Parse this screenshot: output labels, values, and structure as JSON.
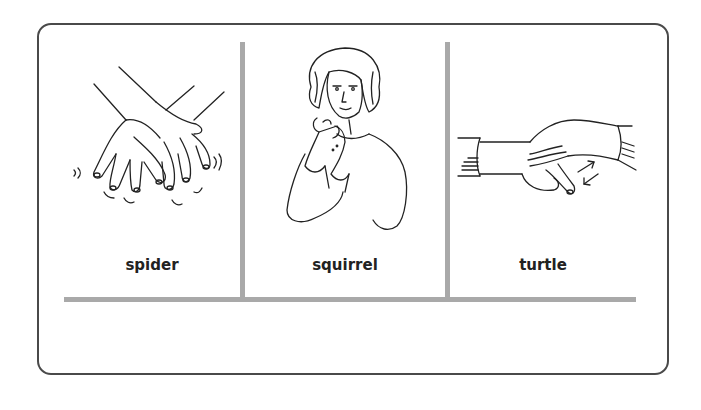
{
  "card": {
    "panels": [
      {
        "label": "spider",
        "illustration": "crossed-hands-wiggling-fingers"
      },
      {
        "label": "squirrel",
        "illustration": "woman-bent-fingers-tapping"
      },
      {
        "label": "turtle",
        "illustration": "hand-covering-fist-thumb-wiggle"
      }
    ]
  },
  "colors": {
    "border": "#4a4a4a",
    "divider": "#a9a9a9",
    "text": "#222222",
    "background": "#ffffff"
  }
}
